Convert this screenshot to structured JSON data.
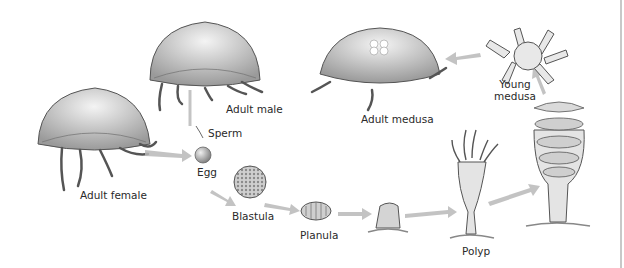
{
  "diagram": {
    "stages": [
      {
        "id": "adult_female",
        "label": "Adult female"
      },
      {
        "id": "adult_male",
        "label": "Adult male"
      },
      {
        "id": "sperm",
        "label": "Sperm"
      },
      {
        "id": "egg",
        "label": "Egg"
      },
      {
        "id": "blastula",
        "label": "Blastula"
      },
      {
        "id": "planula",
        "label": "Planula"
      },
      {
        "id": "settled_planula",
        "label": ""
      },
      {
        "id": "polyp",
        "label": "Polyp"
      },
      {
        "id": "strobila",
        "label": ""
      },
      {
        "id": "young_medusa",
        "label_line1": "Young",
        "label_line2": "medusa"
      },
      {
        "id": "adult_medusa",
        "label": "Adult medusa"
      }
    ],
    "flow": [
      [
        "adult_female",
        "egg"
      ],
      [
        "adult_male",
        "sperm"
      ],
      [
        "sperm",
        "egg"
      ],
      [
        "egg",
        "blastula"
      ],
      [
        "blastula",
        "planula"
      ],
      [
        "planula",
        "settled_planula"
      ],
      [
        "settled_planula",
        "polyp"
      ],
      [
        "polyp",
        "strobila"
      ],
      [
        "strobila",
        "young_medusa"
      ],
      [
        "young_medusa",
        "adult_medusa"
      ]
    ],
    "colors": {
      "arrow": "#b9b9b9",
      "ink": "#4a4a4a",
      "fill_light": "#e6e6e6",
      "fill_mid": "#bdbdbd",
      "text": "#2a2a2a"
    }
  }
}
